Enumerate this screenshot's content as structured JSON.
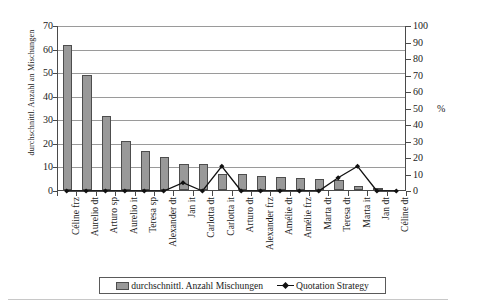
{
  "chart_data": {
    "type": "bar",
    "title": "",
    "xlabel": "",
    "ylabel": "durchschnittl. Anzahl an Mischungen",
    "y2label": "%",
    "ylim": [
      0,
      70
    ],
    "y2lim": [
      0,
      100
    ],
    "grid": true,
    "legend_position": "bottom",
    "y_ticks": [
      0,
      10,
      20,
      30,
      40,
      50,
      60,
      70
    ],
    "y2_ticks": [
      0,
      10,
      20,
      30,
      40,
      50,
      60,
      70,
      80,
      90,
      100
    ],
    "categories": [
      "Céline frz",
      "Aurelio dt",
      "Arturo sp",
      "Aurelio it",
      "Teresa sp",
      "Alexander dt",
      "Jan it",
      "Carlotta dt",
      "Carlotta it",
      "Arturo dt",
      "Alexander frz",
      "Amélie dt",
      "Amélie frz",
      "Marta dt",
      "Teresa dt",
      "Marta it",
      "Jan dt",
      "Céline dt"
    ],
    "series": [
      {
        "name": "durchschnittl. Anzahl Mischungen",
        "type": "bar",
        "axis": "left",
        "color": "#999999",
        "values": [
          61.5,
          48.8,
          31.3,
          20.7,
          16.7,
          13.8,
          11.0,
          10.9,
          6.8,
          6.7,
          5.8,
          5.4,
          5.1,
          4.8,
          4.1,
          1.7,
          1.0,
          0.0
        ]
      },
      {
        "name": "Quotation Strategy",
        "type": "line",
        "axis": "right",
        "color": "#111111",
        "values": [
          0,
          0,
          0,
          0,
          0,
          0,
          5,
          0,
          15,
          0,
          0,
          0,
          0,
          0,
          8,
          15,
          0,
          0
        ]
      }
    ]
  },
  "axes": {
    "left_title": "durchschnittl. Anzahl an Mischungen",
    "right_unit": "%"
  },
  "legend": {
    "items": [
      {
        "label": "durchschnittl. Anzahl Mischungen",
        "marker": "bar-swatch-icon"
      },
      {
        "label": "Quotation Strategy",
        "marker": "line-marker-icon"
      }
    ]
  }
}
